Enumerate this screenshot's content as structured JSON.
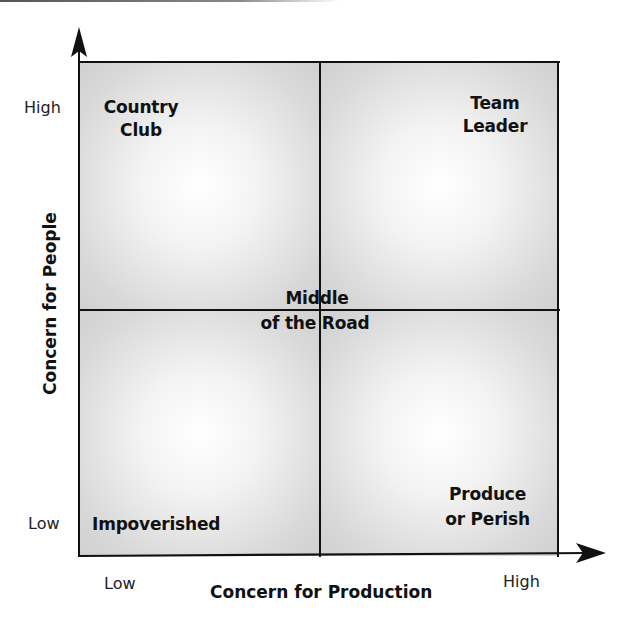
{
  "diagram": {
    "quadrants": {
      "top_left": {
        "line1": "Country",
        "line2": "Club"
      },
      "top_right": {
        "line1": "Team",
        "line2": "Leader"
      },
      "center": {
        "line1": "Middle",
        "line2": "of the Road"
      },
      "bottom_left": {
        "line1": "Impoverished"
      },
      "bottom_right": {
        "line1": "Produce",
        "line2": "or Perish"
      }
    },
    "y_axis": {
      "title": "Concern for People",
      "high": "High",
      "low": "Low"
    },
    "x_axis": {
      "title": "Concern for Production",
      "low": "Low",
      "high": "High"
    }
  }
}
